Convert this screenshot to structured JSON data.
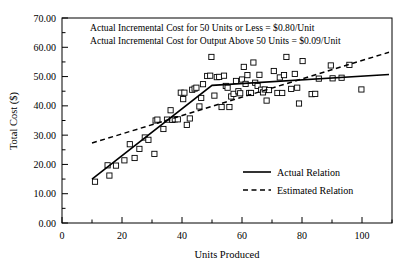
{
  "chart_data": {
    "type": "scatter",
    "title": "",
    "xlabel": "Units Produced",
    "ylabel": "Total Cost ($)",
    "xlim": [
      0,
      110
    ],
    "ylim": [
      0,
      70
    ],
    "grid": false,
    "x_ticks": [
      0,
      20,
      40,
      60,
      80,
      100
    ],
    "x_tick_labels": [
      "0",
      "20",
      "40",
      "60",
      "80",
      "100"
    ],
    "x_minor_ticks": [
      10,
      30,
      50,
      70,
      90,
      110
    ],
    "y_ticks": [
      0,
      10,
      20,
      30,
      40,
      50,
      60,
      70
    ],
    "y_tick_labels": [
      "0.00",
      "10.00",
      "20.00",
      "30.00",
      "40.00",
      "50.00",
      "60.00",
      "70.00"
    ],
    "y_minor_ticks": [
      5,
      15,
      25,
      35,
      45,
      55,
      65
    ],
    "annotations": [
      "Actual Incremental Cost for 50 Units or Less = $0.80/Unit",
      "Actual Incremental Cost for Output Above 50 Units = $0.09/Unit"
    ],
    "legend_position": "center-right",
    "series": [
      {
        "name": "Actual Relation",
        "type": "line",
        "style": "solid",
        "color": "#000000",
        "points": [
          [
            10,
            15.0
          ],
          [
            50,
            47.0
          ],
          [
            109,
            50.7
          ]
        ]
      },
      {
        "name": "Estimated Relation",
        "type": "line",
        "style": "dashed",
        "color": "#000000",
        "points": [
          [
            10,
            27.3
          ],
          [
            109,
            58.3
          ]
        ]
      },
      {
        "name": "Observations",
        "type": "scatter",
        "marker": "open-square",
        "color": "#000000",
        "points": [
          [
            11.0,
            14.1
          ],
          [
            15.2,
            19.7
          ],
          [
            15.8,
            16.2
          ],
          [
            18.0,
            19.6
          ],
          [
            20.8,
            21.4
          ],
          [
            22.6,
            26.9
          ],
          [
            24.2,
            22.2
          ],
          [
            25.8,
            25.3
          ],
          [
            27.6,
            29.2
          ],
          [
            28.8,
            28.4
          ],
          [
            30.8,
            23.6
          ],
          [
            31.2,
            35.0
          ],
          [
            31.8,
            35.3
          ],
          [
            33.8,
            32.1
          ],
          [
            35.0,
            35.3
          ],
          [
            36.2,
            38.5
          ],
          [
            36.8,
            35.2
          ],
          [
            37.6,
            35.4
          ],
          [
            38.6,
            35.4
          ],
          [
            39.6,
            44.5
          ],
          [
            40.4,
            42.3
          ],
          [
            40.8,
            44.5
          ],
          [
            41.6,
            33.5
          ],
          [
            42.6,
            35.7
          ],
          [
            43.4,
            45.5
          ],
          [
            44.2,
            45.9
          ],
          [
            44.8,
            46.2
          ],
          [
            45.8,
            39.8
          ],
          [
            46.4,
            42.7
          ],
          [
            47.0,
            47.4
          ],
          [
            48.4,
            50.2
          ],
          [
            49.4,
            50.3
          ],
          [
            49.8,
            56.7
          ],
          [
            50.8,
            43.5
          ],
          [
            51.6,
            49.8
          ],
          [
            52.4,
            49.9
          ],
          [
            53.2,
            39.6
          ],
          [
            54.0,
            50.3
          ],
          [
            54.6,
            46.8
          ],
          [
            55.2,
            46.2
          ],
          [
            55.8,
            39.6
          ],
          [
            56.4,
            43.2
          ],
          [
            57.2,
            44.1
          ],
          [
            58.0,
            48.5
          ],
          [
            58.8,
            45.0
          ],
          [
            59.4,
            44.3
          ],
          [
            60.0,
            49.0
          ],
          [
            60.6,
            53.3
          ],
          [
            61.2,
            47.5
          ],
          [
            61.8,
            50.5
          ],
          [
            62.4,
            44.4
          ],
          [
            63.0,
            44.4
          ],
          [
            63.8,
            54.8
          ],
          [
            64.4,
            47.9
          ],
          [
            65.2,
            46.8
          ],
          [
            65.8,
            50.6
          ],
          [
            66.4,
            45.5
          ],
          [
            67.0,
            44.6
          ],
          [
            67.6,
            45.6
          ],
          [
            68.2,
            41.8
          ],
          [
            69.0,
            45.4
          ],
          [
            70.6,
            51.9
          ],
          [
            71.8,
            44.4
          ],
          [
            72.6,
            49.7
          ],
          [
            73.4,
            44.4
          ],
          [
            74.0,
            50.5
          ],
          [
            74.8,
            56.7
          ],
          [
            76.4,
            45.8
          ],
          [
            77.6,
            50.9
          ],
          [
            78.4,
            46.2
          ],
          [
            79.0,
            40.8
          ],
          [
            80.2,
            55.3
          ],
          [
            83.2,
            44.0
          ],
          [
            84.4,
            44.1
          ],
          [
            85.6,
            49.3
          ],
          [
            89.6,
            53.8
          ],
          [
            90.2,
            49.4
          ],
          [
            93.2,
            49.6
          ],
          [
            95.8,
            54.0
          ],
          [
            99.8,
            45.6
          ]
        ]
      }
    ]
  }
}
